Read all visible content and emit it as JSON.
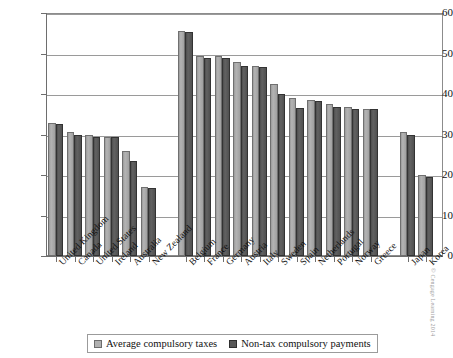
{
  "chart_data": {
    "type": "bar",
    "title": "",
    "xlabel": "",
    "ylabel": "",
    "ylim": [
      0,
      60
    ],
    "yticks": [
      0,
      10,
      20,
      30,
      40,
      50,
      60
    ],
    "grid": true,
    "legend_position": "bottom",
    "categories": [
      "United Kingdom",
      "Canada",
      "United States",
      "Ireland",
      "Australia",
      "New Zealand",
      "Belgium",
      "France",
      "Germany",
      "Austria",
      "Italy",
      "Sweden",
      "Spain",
      "Netherlands",
      "Portugal",
      "Norway",
      "Greece",
      "Japan",
      "Korea"
    ],
    "group_breaks": [
      6,
      17
    ],
    "series": [
      {
        "name": "Average compulsory taxes",
        "color": "#b0b0b0",
        "values": [
          32.8,
          30.5,
          29.8,
          29.5,
          26.0,
          17.0,
          55.5,
          49.5,
          49.5,
          48.0,
          47.0,
          42.5,
          39.0,
          38.5,
          37.5,
          36.7,
          36.3,
          30.5,
          20.0
        ]
      },
      {
        "name": "Non-tax compulsory payments",
        "color": "#585858",
        "values": [
          32.5,
          30.0,
          29.5,
          29.5,
          23.5,
          16.8,
          55.2,
          49.0,
          49.0,
          47.0,
          46.7,
          40.0,
          36.5,
          38.3,
          36.8,
          36.3,
          36.3,
          30.0,
          19.5
        ]
      }
    ]
  },
  "legend": {
    "items": [
      {
        "label": "Average compulsory taxes",
        "swatch": "taxes"
      },
      {
        "label": "Non-tax compulsory payments",
        "swatch": "nontax"
      }
    ]
  },
  "credit": {
    "text": "© Cengage Learning 2014"
  }
}
